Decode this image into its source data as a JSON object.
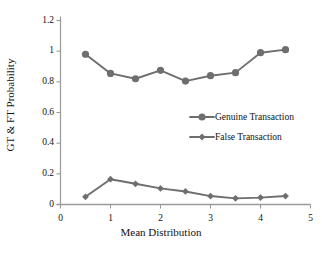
{
  "chart_data": {
    "type": "line",
    "title": "",
    "xlabel": "Mean Distribution",
    "ylabel": "GT & FT Probability",
    "xlim": [
      0,
      5
    ],
    "ylim": [
      0,
      1.2
    ],
    "xticks": [
      "0",
      "1",
      "2",
      "3",
      "4",
      "5"
    ],
    "xtick_values": [
      0,
      1,
      2,
      3,
      4,
      5
    ],
    "yticks": [
      "0",
      "0.2",
      "0.4",
      "0.6",
      "0.8",
      "1",
      "1.2"
    ],
    "ytick_values": [
      0,
      0.2,
      0.4,
      0.6,
      0.8,
      1,
      1.2
    ],
    "grid": false,
    "legend_position": "center-right",
    "x": [
      0.5,
      1.0,
      1.5,
      2.0,
      2.5,
      3.0,
      3.5,
      4.0,
      4.5
    ],
    "series": [
      {
        "name": "Genuine Transaction",
        "marker": "circle",
        "color": "#6e6e6e",
        "values": [
          0.98,
          0.855,
          0.82,
          0.875,
          0.805,
          0.84,
          0.86,
          0.99,
          1.01
        ]
      },
      {
        "name": "False Transaction",
        "marker": "diamond",
        "color": "#6e6e6e",
        "values": [
          0.05,
          0.165,
          0.135,
          0.105,
          0.085,
          0.055,
          0.04,
          0.045,
          0.055
        ]
      }
    ]
  },
  "axis_color": "#9a9a9a",
  "text_color": "#111111"
}
